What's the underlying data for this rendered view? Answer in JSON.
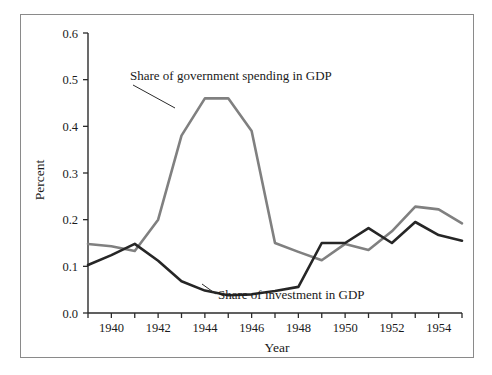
{
  "chart_data": {
    "type": "line",
    "title": "",
    "xlabel": "Year",
    "ylabel": "Percent",
    "xlim": [
      1939,
      1955
    ],
    "ylim": [
      0.0,
      0.6
    ],
    "grid": false,
    "legend_position": "inline-annotations",
    "x": [
      1939,
      1940,
      1941,
      1942,
      1943,
      1944,
      1945,
      1946,
      1947,
      1948,
      1949,
      1950,
      1951,
      1952,
      1953,
      1954,
      1955
    ],
    "xtick_values": [
      1939,
      1940,
      1941,
      1942,
      1943,
      1944,
      1945,
      1946,
      1947,
      1948,
      1949,
      1950,
      1951,
      1952,
      1953,
      1954,
      1955
    ],
    "xtick_labels": [
      "1940",
      "1942",
      "1944",
      "1946",
      "1948",
      "1950",
      "1952",
      "1954"
    ],
    "xtick_labeled_values": [
      1940,
      1942,
      1944,
      1946,
      1948,
      1950,
      1952,
      1954
    ],
    "ytick_values": [
      0.0,
      0.1,
      0.2,
      0.3,
      0.4,
      0.5,
      0.6
    ],
    "ytick_labels": [
      "0.0",
      "0.1",
      "0.2",
      "0.3",
      "0.4",
      "0.5",
      "0.6"
    ],
    "series": [
      {
        "name": "Share of government spending in GDP",
        "color": "#808080",
        "values": [
          0.148,
          0.143,
          0.133,
          0.2,
          0.38,
          0.46,
          0.46,
          0.39,
          0.15,
          0.131,
          0.113,
          0.148,
          0.135,
          0.175,
          0.228,
          0.222,
          0.192
        ]
      },
      {
        "name": "Share of investment in GDP",
        "color": "#262626",
        "values": [
          0.103,
          0.124,
          0.148,
          0.112,
          0.068,
          0.048,
          0.038,
          0.04,
          0.047,
          0.056,
          0.15,
          0.15,
          0.182,
          0.15,
          0.195,
          0.167,
          0.155
        ]
      }
    ],
    "annotations": [
      {
        "text": "Share of government spending in GDP",
        "text_x": 130,
        "text_y": 80,
        "leader_from_x": 133,
        "leader_from_y": 85,
        "leader_to_x": 175,
        "leader_to_y": 108
      },
      {
        "text": "Share of investment in GDP",
        "text_x": 218,
        "text_y": 299,
        "leader_from_x": 216,
        "leader_from_y": 294,
        "leader_to_x": 202,
        "leader_to_y": 284
      }
    ]
  }
}
